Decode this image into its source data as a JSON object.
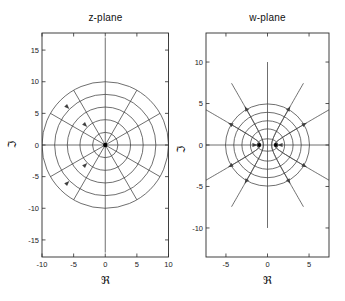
{
  "figure": {
    "background": "#ffffff"
  },
  "style": {
    "curve_color": "#3f3f3f",
    "frame_color": "#2c2c2c",
    "text_color": "#1a1a1a",
    "marker_color": "#000000"
  },
  "chart_data": [
    {
      "type": "line",
      "id": "z-plane",
      "title": "z-plane",
      "xlabel": "ℜ",
      "ylabel": "ℑ",
      "xlim": [
        -10,
        10
      ],
      "ylim": [
        -17.7,
        17.7
      ],
      "xticks": [
        -10,
        -5,
        0,
        5,
        10
      ],
      "yticks": [
        -15,
        -10,
        -5,
        0,
        5,
        10,
        15
      ],
      "grid": false,
      "content": {
        "kind": "polar-grid",
        "circle_radii": [
          2,
          4,
          6,
          8,
          10
        ],
        "ray_angles_deg": [
          30,
          60,
          120,
          150,
          210,
          240,
          300,
          330
        ],
        "ray_rmax": 10,
        "vertical_line_extent": 17,
        "horizontal_line_extent": 10,
        "origin_marker": [
          0,
          0
        ],
        "arrows": [
          {
            "x": -3.25,
            "y": 3.25,
            "dir_deg": 315
          },
          {
            "x": -6.08,
            "y": 6.08,
            "dir_deg": 315
          },
          {
            "x": -3.25,
            "y": -3.25,
            "dir_deg": 45
          },
          {
            "x": -6.08,
            "y": -6.08,
            "dir_deg": 45
          }
        ]
      }
    },
    {
      "type": "line",
      "id": "w-plane",
      "title": "w-plane",
      "xlabel": "ℜ",
      "ylabel": "ℑ",
      "xlim": [
        -7.4,
        7.4
      ],
      "ylim": [
        -13.5,
        13.5
      ],
      "xticks": [
        -5,
        0,
        5
      ],
      "yticks": [
        -10,
        -5,
        0,
        5,
        10
      ],
      "grid": false,
      "content": {
        "kind": "conformal-image-grid",
        "ellipses": [
          {
            "a": 1.25,
            "b": 0.75
          },
          {
            "a": 2.06,
            "b": 1.94
          },
          {
            "a": 3.08,
            "b": 2.92
          },
          {
            "a": 4.06,
            "b": 3.94
          },
          {
            "a": 5.05,
            "b": 4.95
          }
        ],
        "hyperbola_angles_deg": [
          30,
          60,
          120,
          150,
          210,
          240,
          300,
          330
        ],
        "hyperbola_r_range": [
          0.058,
          10
        ],
        "foci_markers": [
          [
            -1,
            0
          ],
          [
            1,
            0
          ]
        ],
        "vertical_line_extent": 10,
        "horizontal_line_extent": 7.4,
        "arrows": [
          {
            "x": 4.37,
            "y": 2.48,
            "dir_deg": 30
          },
          {
            "x": 2.53,
            "y": 4.29,
            "dir_deg": 60
          },
          {
            "x": -2.53,
            "y": 4.29,
            "dir_deg": 120
          },
          {
            "x": -4.37,
            "y": 2.48,
            "dir_deg": 150
          },
          {
            "x": -4.37,
            "y": -2.48,
            "dir_deg": 210
          },
          {
            "x": -2.53,
            "y": -4.29,
            "dir_deg": 240
          },
          {
            "x": 2.53,
            "y": -4.29,
            "dir_deg": 300
          },
          {
            "x": 4.37,
            "y": -2.48,
            "dir_deg": 330
          },
          {
            "x": -1.62,
            "y": 0,
            "dir_deg": 0
          },
          {
            "x": 1.62,
            "y": 0,
            "dir_deg": 180
          }
        ]
      }
    }
  ]
}
